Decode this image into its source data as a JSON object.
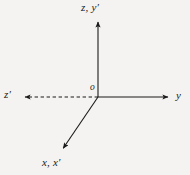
{
  "figure": {
    "kind": "coordinate-axes-diagram",
    "background_color": "#f4f3f1",
    "stroke_color": "#1a1a1a",
    "labels": {
      "vertical_axis": "z, y′",
      "right_axis": "y",
      "left_axis": "z′",
      "diagonal_axis": "x, x′",
      "origin": "o"
    },
    "axes": [
      {
        "name": "vertical-axis",
        "label": "z, y′",
        "style": "solid",
        "arrow": "end",
        "from": [
          98,
          97
        ],
        "to": [
          98,
          18
        ]
      },
      {
        "name": "right-axis",
        "label": "y",
        "style": "solid",
        "arrow": "end",
        "from": [
          98,
          97
        ],
        "to": [
          172,
          97
        ]
      },
      {
        "name": "left-axis",
        "label": "z′",
        "style": "dashed",
        "arrow": "end",
        "from": [
          98,
          97
        ],
        "to": [
          20,
          97
        ]
      },
      {
        "name": "diagonal-axis",
        "label": "x, x′",
        "style": "solid",
        "arrow": "end",
        "from": [
          98,
          97
        ],
        "to": [
          60,
          153
        ]
      }
    ]
  }
}
